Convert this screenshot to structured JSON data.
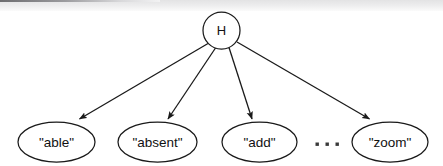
{
  "diagram": {
    "type": "tree",
    "root": {
      "id": "root",
      "label": "H",
      "shape": "circle",
      "cx": 221.5,
      "cy": 30.5,
      "r": 18.5
    },
    "leaves": [
      {
        "id": "leaf-able",
        "label": "\"able\"",
        "shape": "ellipse",
        "cx": 56.5,
        "cy": 142,
        "rx": 38.5,
        "ry": 20
      },
      {
        "id": "leaf-absent",
        "label": "\"absent\"",
        "shape": "ellipse",
        "cx": 157.5,
        "cy": 142,
        "rx": 39.5,
        "ry": 20
      },
      {
        "id": "leaf-add",
        "label": "\"add\"",
        "shape": "ellipse",
        "cx": 259.5,
        "cy": 142,
        "rx": 37.5,
        "ry": 20
      },
      {
        "id": "leaf-zoom",
        "label": "\"zoom\"",
        "shape": "ellipse",
        "cx": 390,
        "cy": 142,
        "rx": 38,
        "ry": 20
      }
    ],
    "edges": [
      {
        "id": "edge-root-able",
        "from": "root",
        "to": "leaf-able",
        "arrow": "filled-triangle"
      },
      {
        "id": "edge-root-absent",
        "from": "root",
        "to": "leaf-absent",
        "arrow": "filled-triangle"
      },
      {
        "id": "edge-root-add",
        "from": "root",
        "to": "leaf-add",
        "arrow": "filled-triangle"
      },
      {
        "id": "edge-root-zoom",
        "from": "root",
        "to": "leaf-zoom",
        "arrow": "filled-triangle"
      }
    ],
    "ellipsis": {
      "id": "ellipsis-more-leaves",
      "label": "...",
      "dots": [
        {
          "cx": 318,
          "cy": 145
        },
        {
          "cx": 328,
          "cy": 145
        },
        {
          "cx": 338,
          "cy": 145
        }
      ]
    },
    "colors": {
      "background": "#ffffff",
      "stroke": "#1a1a1a",
      "text": "#111111",
      "scan_band": "#e8e8e9"
    }
  }
}
